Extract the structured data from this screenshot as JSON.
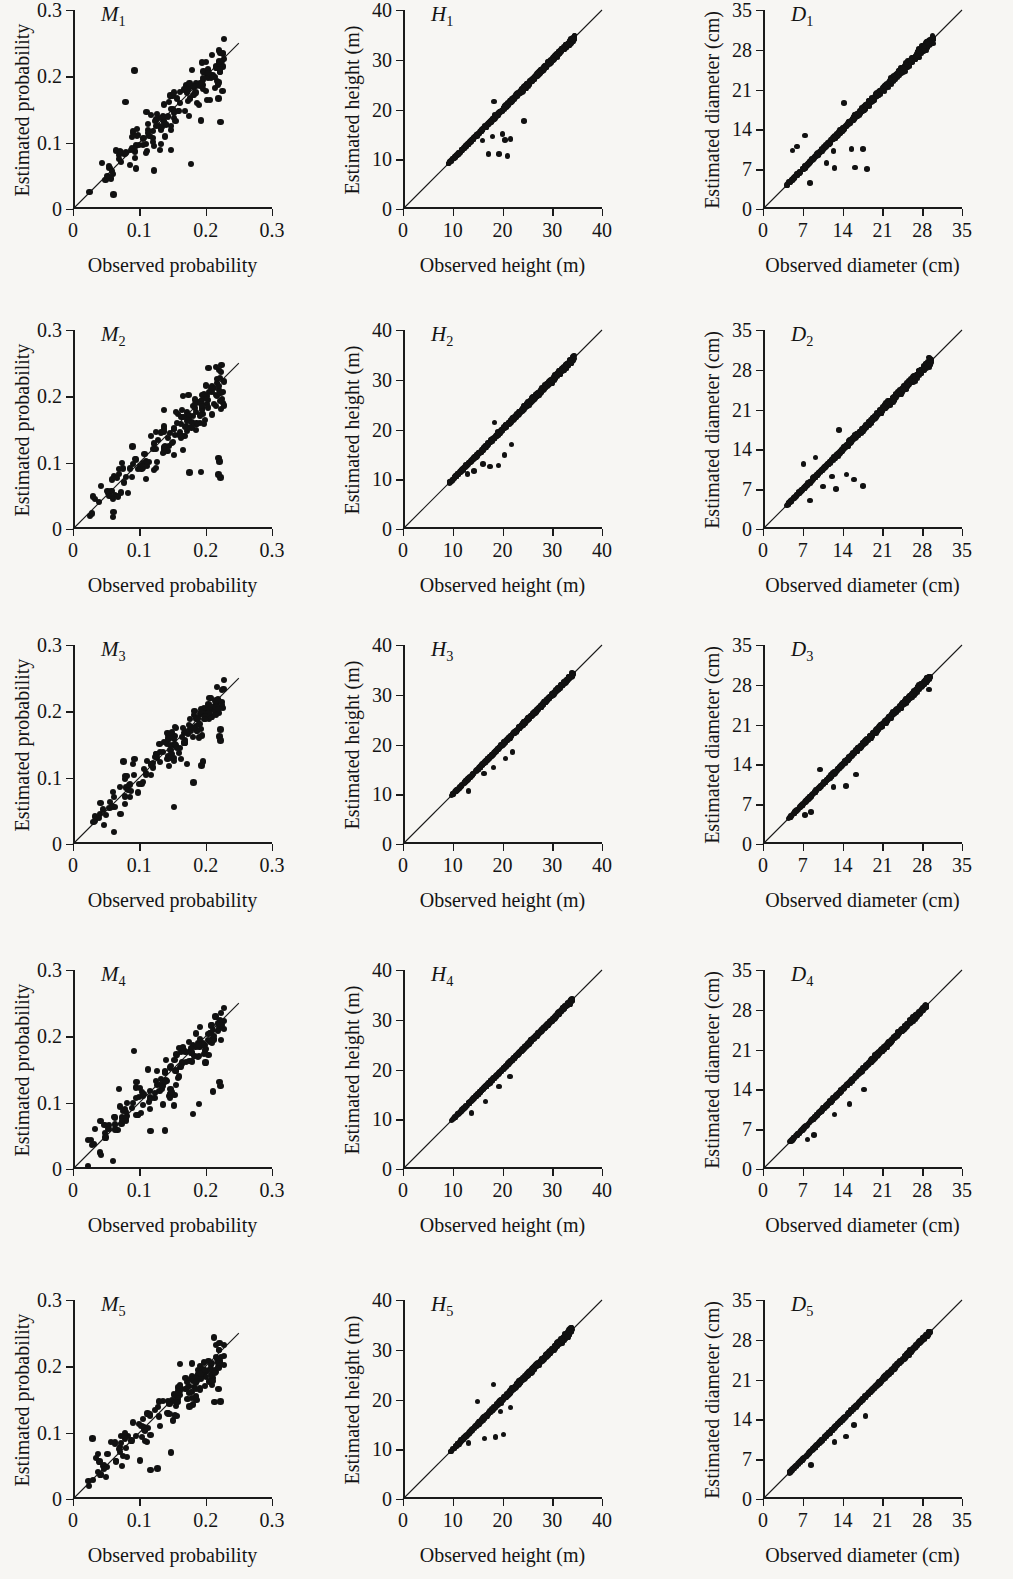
{
  "figure": {
    "rows": 5,
    "columns": 3,
    "background_color": "#f7f6f3",
    "ink_color": "#141414",
    "point_color": "#111111"
  },
  "axes_templates": {
    "probability": {
      "xlabel": "Observed probability",
      "ylabel": "Estimated probability",
      "xticks": [
        "0",
        "0.1",
        "0.2",
        "0.3"
      ],
      "xtick_values": [
        0,
        0.1,
        0.2,
        0.3
      ],
      "yticks": [
        "0",
        "0.1",
        "0.2",
        "0.3"
      ],
      "ytick_values": [
        0,
        0.1,
        0.2,
        0.3
      ],
      "xlim": [
        0,
        0.3
      ],
      "ylim": [
        0,
        0.3
      ]
    },
    "height": {
      "xlabel": "Observed height (m)",
      "ylabel": "Estimated height (m)",
      "xticks": [
        "0",
        "10",
        "20",
        "30",
        "40"
      ],
      "xtick_values": [
        0,
        10,
        20,
        30,
        40
      ],
      "yticks": [
        "0",
        "10",
        "20",
        "30",
        "40"
      ],
      "ytick_values": [
        0,
        10,
        20,
        30,
        40
      ],
      "xlim": [
        0,
        40
      ],
      "ylim": [
        0,
        40
      ]
    },
    "diameter": {
      "xlabel": "Observed diameter (cm)",
      "ylabel": "Estimated diameter (cm)",
      "xticks": [
        "0",
        "7",
        "14",
        "21",
        "28",
        "35"
      ],
      "xtick_values": [
        0,
        7,
        14,
        21,
        28,
        35
      ],
      "yticks": [
        "0",
        "7",
        "14",
        "21",
        "28",
        "35"
      ],
      "ytick_values": [
        0,
        7,
        14,
        21,
        28,
        35
      ],
      "xlim": [
        0,
        35
      ],
      "ylim": [
        0,
        35
      ]
    }
  },
  "chart_data": [
    {
      "id": "M1",
      "type": "scatter",
      "row": 1,
      "column": 1,
      "tag_letter": "M",
      "tag_sub": "1",
      "axes": "probability",
      "title": "",
      "xlabel": "Observed probability",
      "ylabel": "Estimated probability",
      "xlim": [
        0,
        0.3
      ],
      "ylim": [
        0,
        0.3
      ],
      "grid": false,
      "legend": false,
      "reference_line": {
        "type": "identity",
        "from": [
          0,
          0
        ],
        "to": [
          0.25,
          0.25
        ]
      },
      "n_points": 150,
      "spread": 0.33,
      "x_min": 0.018,
      "x_max": 0.228,
      "seed": 11,
      "outliers": [
        [
          0.093,
          0.209
        ],
        [
          0.079,
          0.161
        ],
        [
          0.219,
          0.191
        ],
        [
          0.219,
          0.167
        ],
        [
          0.222,
          0.131
        ],
        [
          0.193,
          0.133
        ],
        [
          0.178,
          0.068
        ],
        [
          0.148,
          0.089
        ],
        [
          0.131,
          0.089
        ],
        [
          0.122,
          0.058
        ],
        [
          0.061,
          0.022
        ]
      ]
    },
    {
      "id": "H1",
      "type": "scatter",
      "row": 1,
      "column": 2,
      "tag_letter": "H",
      "tag_sub": "1",
      "axes": "height",
      "title": "",
      "xlabel": "Observed height (m)",
      "ylabel": "Estimated height (m)",
      "xlim": [
        0,
        40
      ],
      "ylim": [
        0,
        40
      ],
      "grid": false,
      "legend": false,
      "reference_line": {
        "type": "identity",
        "from": [
          0,
          0
        ],
        "to": [
          40,
          40
        ]
      },
      "n_points": 900,
      "spread": 0.052,
      "x_min": 9.0,
      "x_max": 34.6,
      "seed": 21,
      "outliers": [
        [
          18.3,
          21.6
        ],
        [
          20.0,
          15.1
        ],
        [
          24.3,
          17.7
        ],
        [
          21.0,
          10.6
        ],
        [
          19.3,
          11.0
        ],
        [
          17.2,
          11.0
        ],
        [
          20.5,
          13.9
        ],
        [
          21.6,
          14.1
        ],
        [
          16.0,
          13.8
        ],
        [
          18.0,
          14.6
        ]
      ]
    },
    {
      "id": "D1",
      "type": "scatter",
      "row": 1,
      "column": 3,
      "tag_letter": "D",
      "tag_sub": "1",
      "axes": "diameter",
      "title": "",
      "xlabel": "Observed diameter (cm)",
      "ylabel": "Estimated diameter (cm)",
      "xlim": [
        0,
        35
      ],
      "ylim": [
        0,
        35
      ],
      "grid": false,
      "legend": false,
      "reference_line": {
        "type": "identity",
        "from": [
          0,
          0
        ],
        "to": [
          35,
          35
        ]
      },
      "n_points": 900,
      "spread": 0.085,
      "x_min": 4.0,
      "x_max": 30.0,
      "seed": 31,
      "outliers": [
        [
          14.2,
          18.6
        ],
        [
          5.2,
          10.3
        ],
        [
          6.0,
          11.0
        ],
        [
          7.4,
          12.9
        ],
        [
          12.4,
          10.2
        ],
        [
          15.6,
          10.6
        ],
        [
          17.6,
          10.6
        ],
        [
          18.3,
          7.0
        ],
        [
          16.2,
          7.3
        ],
        [
          12.6,
          7.2
        ],
        [
          8.3,
          4.6
        ],
        [
          11.2,
          8.1
        ]
      ]
    },
    {
      "id": "M2",
      "type": "scatter",
      "row": 2,
      "column": 1,
      "tag_letter": "M",
      "tag_sub": "2",
      "axes": "probability",
      "title": "",
      "xlabel": "Observed probability",
      "ylabel": "Estimated probability",
      "xlim": [
        0,
        0.3
      ],
      "ylim": [
        0,
        0.3
      ],
      "grid": false,
      "legend": false,
      "reference_line": {
        "type": "identity",
        "from": [
          0,
          0
        ],
        "to": [
          0.25,
          0.25
        ]
      },
      "n_points": 150,
      "spread": 0.38,
      "x_min": 0.018,
      "x_max": 0.228,
      "seed": 12,
      "outliers": [
        [
          0.17,
          0.154
        ],
        [
          0.179,
          0.153
        ],
        [
          0.09,
          0.124
        ],
        [
          0.219,
          0.107
        ],
        [
          0.221,
          0.102
        ],
        [
          0.222,
          0.078
        ],
        [
          0.219,
          0.082
        ],
        [
          0.193,
          0.086
        ],
        [
          0.176,
          0.085
        ],
        [
          0.166,
          0.119
        ],
        [
          0.06,
          0.018
        ]
      ]
    },
    {
      "id": "H2",
      "type": "scatter",
      "row": 2,
      "column": 2,
      "tag_letter": "H",
      "tag_sub": "2",
      "axes": "height",
      "title": "",
      "xlabel": "Observed height (m)",
      "ylabel": "Estimated height (m)",
      "xlim": [
        0,
        40
      ],
      "ylim": [
        0,
        40
      ],
      "grid": false,
      "legend": false,
      "reference_line": {
        "type": "identity",
        "from": [
          0,
          0
        ],
        "to": [
          40,
          40
        ]
      },
      "n_points": 900,
      "spread": 0.058,
      "x_min": 9.2,
      "x_max": 34.4,
      "seed": 22,
      "outliers": [
        [
          18.4,
          21.4
        ],
        [
          16.1,
          13.1
        ],
        [
          17.5,
          12.6
        ],
        [
          19.2,
          12.8
        ],
        [
          20.4,
          14.9
        ],
        [
          14.3,
          11.6
        ],
        [
          21.8,
          17.0
        ],
        [
          13.0,
          11.0
        ]
      ]
    },
    {
      "id": "D2",
      "type": "scatter",
      "row": 2,
      "column": 3,
      "tag_letter": "D",
      "tag_sub": "2",
      "axes": "diameter",
      "title": "",
      "xlabel": "Observed diameter (cm)",
      "ylabel": "Estimated diameter (cm)",
      "xlim": [
        0,
        35
      ],
      "ylim": [
        0,
        35
      ],
      "grid": false,
      "legend": false,
      "reference_line": {
        "type": "identity",
        "from": [
          0,
          0
        ],
        "to": [
          35,
          35
        ]
      },
      "n_points": 900,
      "spread": 0.08,
      "x_min": 4.2,
      "x_max": 29.6,
      "seed": 32,
      "outliers": [
        [
          13.4,
          17.4
        ],
        [
          7.1,
          11.4
        ],
        [
          9.2,
          12.6
        ],
        [
          12.1,
          9.2
        ],
        [
          14.7,
          9.6
        ],
        [
          16.0,
          8.7
        ],
        [
          17.6,
          7.6
        ],
        [
          12.8,
          7.0
        ],
        [
          10.6,
          7.5
        ],
        [
          8.3,
          5.0
        ]
      ]
    },
    {
      "id": "M3",
      "type": "scatter",
      "row": 3,
      "column": 1,
      "tag_letter": "M",
      "tag_sub": "3",
      "axes": "probability",
      "title": "",
      "xlabel": "Observed probability",
      "ylabel": "Estimated probability",
      "xlim": [
        0,
        0.3
      ],
      "ylim": [
        0,
        0.3
      ],
      "grid": false,
      "legend": false,
      "reference_line": {
        "type": "identity",
        "from": [
          0,
          0
        ],
        "to": [
          0.25,
          0.25
        ]
      },
      "n_points": 150,
      "spread": 0.29,
      "x_min": 0.018,
      "x_max": 0.228,
      "seed": 13,
      "outliers": [
        [
          0.222,
          0.173
        ],
        [
          0.221,
          0.162
        ],
        [
          0.222,
          0.156
        ],
        [
          0.196,
          0.124
        ],
        [
          0.194,
          0.118
        ],
        [
          0.182,
          0.093
        ],
        [
          0.152,
          0.056
        ],
        [
          0.062,
          0.018
        ],
        [
          0.076,
          0.124
        ]
      ]
    },
    {
      "id": "H3",
      "type": "scatter",
      "row": 3,
      "column": 2,
      "tag_letter": "H",
      "tag_sub": "3",
      "axes": "height",
      "title": "",
      "xlabel": "Observed height (m)",
      "ylabel": "Estimated height (m)",
      "xlim": [
        0,
        40
      ],
      "ylim": [
        0,
        40
      ],
      "grid": false,
      "legend": false,
      "reference_line": {
        "type": "identity",
        "from": [
          0,
          0
        ],
        "to": [
          40,
          40
        ]
      },
      "n_points": 900,
      "spread": 0.033,
      "x_min": 9.6,
      "x_max": 34.2,
      "seed": 23,
      "outliers": [
        [
          20.6,
          17.2
        ],
        [
          18.2,
          15.4
        ],
        [
          16.3,
          14.2
        ],
        [
          13.2,
          10.6
        ],
        [
          22.0,
          18.5
        ]
      ]
    },
    {
      "id": "D3",
      "type": "scatter",
      "row": 3,
      "column": 3,
      "tag_letter": "D",
      "tag_sub": "3",
      "axes": "diameter",
      "title": "",
      "xlabel": "Observed diameter (cm)",
      "ylabel": "Estimated diameter (cm)",
      "xlim": [
        0,
        35
      ],
      "ylim": [
        0,
        35
      ],
      "grid": false,
      "legend": false,
      "reference_line": {
        "type": "identity",
        "from": [
          0,
          0
        ],
        "to": [
          35,
          35
        ]
      },
      "n_points": 900,
      "spread": 0.06,
      "x_min": 4.4,
      "x_max": 29.4,
      "seed": 33,
      "outliers": [
        [
          29.2,
          27.2
        ],
        [
          10.0,
          13.1
        ],
        [
          12.4,
          10.0
        ],
        [
          14.6,
          10.2
        ],
        [
          8.4,
          5.6
        ],
        [
          16.4,
          12.2
        ],
        [
          7.4,
          5.1
        ]
      ]
    },
    {
      "id": "M4",
      "type": "scatter",
      "row": 4,
      "column": 1,
      "tag_letter": "M",
      "tag_sub": "4",
      "axes": "probability",
      "title": "",
      "xlabel": "Observed probability",
      "ylabel": "Estimated probability",
      "xlim": [
        0,
        0.3
      ],
      "ylim": [
        0,
        0.3
      ],
      "grid": false,
      "legend": false,
      "reference_line": {
        "type": "identity",
        "from": [
          0,
          0
        ],
        "to": [
          0.25,
          0.25
        ]
      },
      "n_points": 150,
      "spread": 0.34,
      "x_min": 0.018,
      "x_max": 0.228,
      "seed": 14,
      "outliers": [
        [
          0.092,
          0.178
        ],
        [
          0.176,
          0.163
        ],
        [
          0.221,
          0.131
        ],
        [
          0.222,
          0.125
        ],
        [
          0.211,
          0.117
        ],
        [
          0.181,
          0.083
        ],
        [
          0.19,
          0.098
        ],
        [
          0.152,
          0.096
        ],
        [
          0.139,
          0.058
        ],
        [
          0.117,
          0.057
        ],
        [
          0.06,
          0.012
        ]
      ]
    },
    {
      "id": "H4",
      "type": "scatter",
      "row": 4,
      "column": 2,
      "tag_letter": "H",
      "tag_sub": "4",
      "axes": "height",
      "title": "",
      "xlabel": "Observed height (m)",
      "ylabel": "Estimated height (m)",
      "xlim": [
        0,
        40
      ],
      "ylim": [
        0,
        40
      ],
      "grid": false,
      "legend": false,
      "reference_line": {
        "type": "identity",
        "from": [
          0,
          0
        ],
        "to": [
          40,
          40
        ]
      },
      "n_points": 900,
      "spread": 0.031,
      "x_min": 9.8,
      "x_max": 34.0,
      "seed": 24,
      "outliers": [
        [
          19.3,
          16.6
        ],
        [
          16.6,
          13.6
        ],
        [
          21.5,
          18.6
        ],
        [
          13.8,
          11.2
        ]
      ]
    },
    {
      "id": "D4",
      "type": "scatter",
      "row": 4,
      "column": 3,
      "tag_letter": "D",
      "tag_sub": "4",
      "axes": "diameter",
      "title": "",
      "xlabel": "Observed diameter (cm)",
      "ylabel": "Estimated diameter (cm)",
      "xlim": [
        0,
        35
      ],
      "ylim": [
        0,
        35
      ],
      "grid": false,
      "legend": false,
      "reference_line": {
        "type": "identity",
        "from": [
          0,
          0
        ],
        "to": [
          35,
          35
        ]
      },
      "n_points": 900,
      "spread": 0.05,
      "x_min": 4.6,
      "x_max": 28.8,
      "seed": 34,
      "outliers": [
        [
          12.6,
          9.6
        ],
        [
          15.2,
          11.4
        ],
        [
          9.0,
          6.0
        ],
        [
          17.8,
          14.0
        ],
        [
          7.8,
          5.2
        ]
      ]
    },
    {
      "id": "M5",
      "type": "scatter",
      "row": 5,
      "column": 1,
      "tag_letter": "M",
      "tag_sub": "5",
      "axes": "probability",
      "title": "",
      "xlabel": "Observed probability",
      "ylabel": "Estimated probability",
      "xlim": [
        0,
        0.3
      ],
      "ylim": [
        0,
        0.3
      ],
      "grid": false,
      "legend": false,
      "reference_line": {
        "type": "identity",
        "from": [
          0,
          0
        ],
        "to": [
          0.25,
          0.25
        ]
      },
      "n_points": 150,
      "spread": 0.3,
      "x_min": 0.018,
      "x_max": 0.228,
      "seed": 15,
      "outliers": [
        [
          0.219,
          0.166
        ],
        [
          0.222,
          0.147
        ],
        [
          0.213,
          0.146
        ],
        [
          0.186,
          0.149
        ],
        [
          0.176,
          0.139
        ],
        [
          0.148,
          0.07
        ],
        [
          0.127,
          0.046
        ],
        [
          0.117,
          0.044
        ],
        [
          0.029,
          0.091
        ],
        [
          0.101,
          0.058
        ]
      ]
    },
    {
      "id": "H5",
      "type": "scatter",
      "row": 5,
      "column": 2,
      "tag_letter": "H",
      "tag_sub": "5",
      "axes": "height",
      "title": "",
      "xlabel": "Observed height (m)",
      "ylabel": "Estimated height (m)",
      "xlim": [
        0,
        40
      ],
      "ylim": [
        0,
        40
      ],
      "grid": false,
      "legend": false,
      "reference_line": {
        "type": "identity",
        "from": [
          0,
          0
        ],
        "to": [
          40,
          40
        ]
      },
      "n_points": 900,
      "spread": 0.06,
      "x_min": 9.4,
      "x_max": 34.0,
      "seed": 25,
      "outliers": [
        [
          18.2,
          23.0
        ],
        [
          15.0,
          19.6
        ],
        [
          19.6,
          17.6
        ],
        [
          18.6,
          12.5
        ],
        [
          16.4,
          12.2
        ],
        [
          20.2,
          13.0
        ],
        [
          21.6,
          18.4
        ],
        [
          13.2,
          11.2
        ]
      ]
    },
    {
      "id": "D5",
      "type": "scatter",
      "row": 5,
      "column": 3,
      "tag_letter": "D",
      "tag_sub": "5",
      "axes": "diameter",
      "title": "",
      "xlabel": "Observed diameter (cm)",
      "ylabel": "Estimated diameter (cm)",
      "xlim": [
        0,
        35
      ],
      "ylim": [
        0,
        35
      ],
      "grid": false,
      "legend": false,
      "reference_line": {
        "type": "identity",
        "from": [
          0,
          0
        ],
        "to": [
          35,
          35
        ]
      },
      "n_points": 900,
      "spread": 0.04,
      "x_min": 4.6,
      "x_max": 29.4,
      "seed": 35,
      "outliers": [
        [
          18.0,
          14.6
        ],
        [
          14.6,
          11.0
        ],
        [
          12.6,
          10.0
        ],
        [
          8.4,
          6.0
        ],
        [
          16.0,
          13.0
        ]
      ]
    }
  ]
}
